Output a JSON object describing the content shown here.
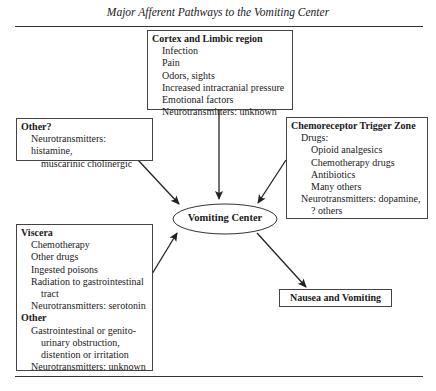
{
  "title": "Major Afferent Pathways to the Vomiting Center",
  "cortex": {
    "heading": "Cortex and Limbic region",
    "items": [
      "Infection",
      "Pain",
      "Odors, sights",
      "Increased intracranial pressure",
      "Emotional factors",
      "Neurotransmitters: unknown"
    ]
  },
  "other_q": {
    "heading": "Other?",
    "lines": [
      "Neurotransmitters: histamine,",
      "muscarinic cholinergic"
    ]
  },
  "ctz": {
    "heading": "Chemoreceptor Trigger Zone",
    "drugs_label": "Drugs:",
    "drugs": [
      "Opioid analgesics",
      "Chemotherapy drugs",
      "Antibiotics",
      "Many others"
    ],
    "nt_line1": "Neurotransmitters: dopamine,",
    "nt_line2": "? others"
  },
  "center": {
    "label": "Vomiting Center"
  },
  "viscera": {
    "heading": "Viscera",
    "items": [
      "Chemotherapy",
      "Other drugs",
      "Ingested poisons",
      "Radiation to gastrointestinal"
    ],
    "item_cont": "tract",
    "nt": "Neurotransmitters: serotonin",
    "other_heading": "Other",
    "other_lines": [
      "Gastrointestinal or genito-",
      "urinary obstruction,",
      "distention or irritation"
    ],
    "other_nt": "Neurotransmitters: unknown"
  },
  "outcome": {
    "label": "Nausea and Vomiting"
  }
}
